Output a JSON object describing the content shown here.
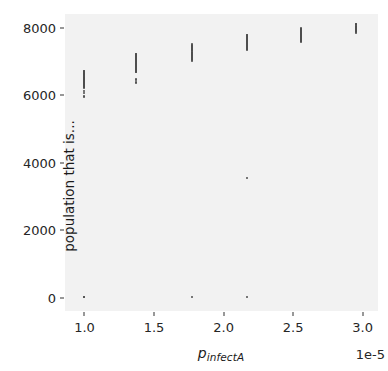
{
  "chart_data": {
    "type": "scatter",
    "title": "",
    "xlabel": "p_infectA",
    "xlabel_base": "p",
    "xlabel_sub": "infectA",
    "ylabel": "population that is...",
    "x_offset_text": "1e-5",
    "x_offset_multiplier": 1e-05,
    "xlim": [
      8.6e-06,
      3.11e-05
    ],
    "ylim": [
      -390,
      8400
    ],
    "grid": false,
    "legend": null,
    "xticks": [
      1.0,
      1.5,
      2.0,
      2.5,
      3.0
    ],
    "xtick_labels": [
      "1.0",
      "1.5",
      "2.0",
      "2.5",
      "3.0"
    ],
    "yticks": [
      0,
      2000,
      4000,
      6000,
      8000
    ],
    "ytick_labels": [
      "0",
      "2000",
      "4000",
      "6000",
      "8000"
    ],
    "marker_color": "#4d4d4d",
    "panel_color": "#f2f2f2",
    "groups": [
      {
        "x": 1.0,
        "x_scaled": 1e-05,
        "y_values": [
          6720,
          6700,
          6680,
          6655,
          6640,
          6625,
          6610,
          6595,
          6580,
          6565,
          6550,
          6535,
          6520,
          6505,
          6490,
          6475,
          6460,
          6445,
          6430,
          6415,
          6400,
          6385,
          6370,
          6355,
          6340,
          6325,
          6310,
          6295,
          6280,
          6265,
          6250,
          6235,
          6220,
          6135,
          6050,
          5975,
          5955,
          30,
          10
        ]
      },
      {
        "x": 1.37,
        "x_scaled": 1.37e-05,
        "y_values": [
          7230,
          7210,
          7190,
          7170,
          7150,
          7130,
          7110,
          7090,
          7070,
          7050,
          7030,
          7010,
          6990,
          6970,
          6950,
          6930,
          6910,
          6890,
          6870,
          6850,
          6830,
          6810,
          6790,
          6770,
          6750,
          6730,
          6710,
          6690,
          6670,
          6470,
          6440,
          6400,
          6370
        ]
      },
      {
        "x": 1.77,
        "x_scaled": 1.77e-05,
        "y_values": [
          7500,
          7480,
          7460,
          7440,
          7420,
          7400,
          7380,
          7360,
          7340,
          7320,
          7300,
          7280,
          7260,
          7240,
          7220,
          7200,
          7180,
          7160,
          7140,
          7120,
          7100,
          7080,
          7060,
          7040,
          7020,
          20
        ]
      },
      {
        "x": 2.17,
        "x_scaled": 2.17e-05,
        "y_values": [
          7790,
          7770,
          7750,
          7730,
          7710,
          7690,
          7670,
          7650,
          7630,
          7610,
          7590,
          7570,
          7550,
          7530,
          7510,
          7490,
          7470,
          7450,
          7430,
          7410,
          7390,
          7370,
          7350,
          7330,
          3550,
          15
        ]
      },
      {
        "x": 2.56,
        "x_scaled": 2.56e-05,
        "y_values": [
          7990,
          7970,
          7950,
          7930,
          7910,
          7890,
          7870,
          7850,
          7830,
          7810,
          7790,
          7770,
          7750,
          7730,
          7710,
          7690,
          7670,
          7650,
          7630,
          7610,
          7590,
          7570
        ]
      },
      {
        "x": 2.95,
        "x_scaled": 2.95e-05,
        "y_values": [
          8110,
          8090,
          8070,
          8050,
          8030,
          8010,
          7990,
          7970,
          7950,
          7930,
          7910,
          7890,
          7870,
          7850
        ]
      }
    ]
  }
}
